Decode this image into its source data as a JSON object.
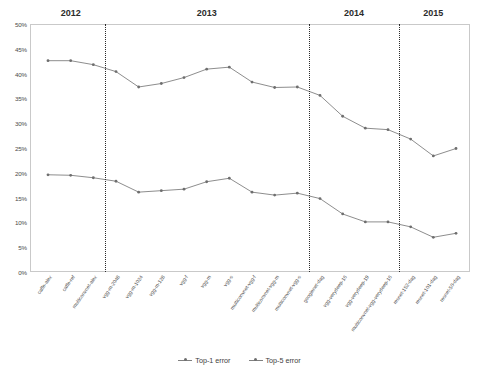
{
  "chart_data": {
    "type": "line",
    "title": "",
    "xlabel": "",
    "ylabel": "",
    "ylim": [
      0,
      50
    ],
    "ytick_labels": [
      "50%",
      "45%",
      "40%",
      "35%",
      "30%",
      "25%",
      "20%",
      "15%",
      "10%",
      "5%",
      "0%"
    ],
    "ytick_values": [
      50,
      45,
      40,
      35,
      30,
      25,
      20,
      15,
      10,
      5,
      0
    ],
    "grid": false,
    "legend_position": "bottom",
    "categories": [
      "caffe-alex",
      "caffe-ref",
      "multiconvnet-alex",
      "vgg-m-2048",
      "vgg-m-1024",
      "vgg-m-128",
      "vgg-f",
      "vgg-m",
      "vgg-s",
      "multiconvnet-vgg-f",
      "multiconvnet-vgg-m",
      "multiconvnet-vgg-s",
      "googlenet-dag",
      "vgg-verydeep-16",
      "vgg-verydeep-19",
      "multiconvnet-vgg-verydeep-16",
      "resnet-152-dag",
      "resnet-101-dag",
      "resnet-50-dag"
    ],
    "series": [
      {
        "name": "Top-1 error",
        "values": [
          42.6,
          42.6,
          41.8,
          40.4,
          37.3,
          38.0,
          39.2,
          40.9,
          41.3,
          38.3,
          37.2,
          37.3,
          35.6,
          31.4,
          29.0,
          28.7,
          26.8,
          23.4,
          24.9
        ],
        "color": "#808080"
      },
      {
        "name": "Top-5 error",
        "values": [
          19.6,
          19.5,
          19.0,
          18.3,
          16.1,
          16.4,
          16.7,
          18.2,
          18.9,
          16.1,
          15.5,
          15.9,
          14.8,
          11.7,
          10.1,
          10.1,
          9.1,
          7.0,
          7.8
        ],
        "color": "#808080"
      }
    ],
    "year_groups": [
      {
        "label": "2012",
        "start_index": 0,
        "end_index": 2
      },
      {
        "label": "2013",
        "start_index": 3,
        "end_index": 11
      },
      {
        "label": "2014",
        "start_index": 12,
        "end_index": 15
      },
      {
        "label": "2015",
        "start_index": 16,
        "end_index": 18
      }
    ],
    "divider_after_indices": [
      2,
      11,
      15
    ]
  }
}
